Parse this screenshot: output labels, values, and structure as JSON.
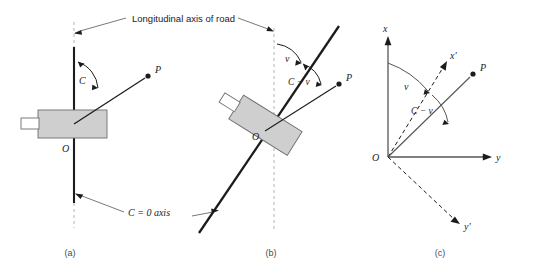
{
  "figure": {
    "background": "#ffffff",
    "ink": "#1c1c1c",
    "caption_color": "#4a4a4a",
    "vehicle_fill": "#cfcfcf",
    "vehicle_stroke": "#6e6e6e",
    "dash_color": "#b4b4b4",
    "thin_line": "#555555"
  },
  "annotations": {
    "longitudinal_axis": "Longitudinal axis of road",
    "c_zero_axis": "C = 0 axis"
  },
  "panels": [
    {
      "id": "a",
      "caption": "(a)",
      "origin_label": "O",
      "point_label": "P",
      "angle_labels": [
        "C"
      ]
    },
    {
      "id": "b",
      "caption": "(b)",
      "origin_label": "O",
      "point_label": "P",
      "angle_labels": [
        "v",
        "C − v"
      ]
    },
    {
      "id": "c",
      "caption": "(c)",
      "origin_label": "O",
      "point_label": "P",
      "angle_labels": [
        "v",
        "C − v"
      ],
      "axis_labels": [
        "x",
        "y",
        "x'",
        "y'"
      ]
    }
  ]
}
